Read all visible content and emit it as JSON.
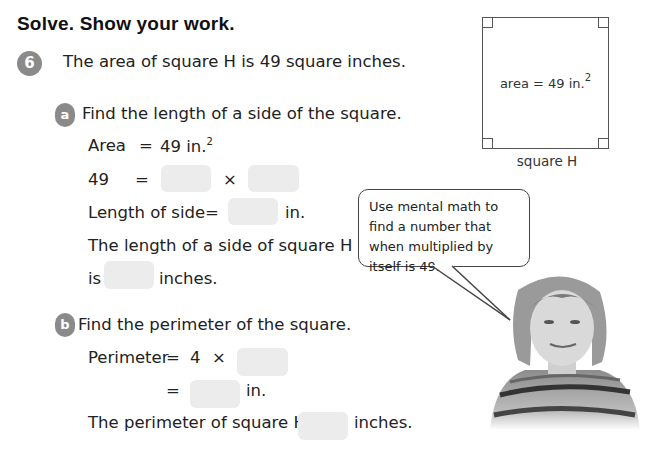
{
  "heading": "Solve. Show your work.",
  "problem": {
    "number": "6",
    "statement": "The area of square H is 49 square inches.",
    "part_a": {
      "letter": "a",
      "prompt": "Find the length of a side of the square.",
      "line1_label": "Area",
      "line1_eq": "=",
      "line1_value": "49 in.",
      "line1_sup": "2",
      "line2_label": "49",
      "line2_eq": "=",
      "line2_times": "×",
      "line3_label": "Length of side",
      "line3_eq": "=",
      "line3_unit": "in.",
      "line4": "The length of a side of square H",
      "line5_prefix": "is",
      "line5_suffix": "inches."
    },
    "part_b": {
      "letter": "b",
      "prompt": "Find the perimeter of the square.",
      "line1_label": "Perimeter",
      "line1_eq": "=",
      "line1_four": "4",
      "line1_times": "×",
      "line2_eq": "=",
      "line2_unit": "in.",
      "line3_prefix": "The perimeter of square H is",
      "line3_suffix": "inches."
    }
  },
  "figure": {
    "label": "area = 49 in.",
    "label_sup": "2",
    "caption": "square H"
  },
  "hint_bubble": "Use mental math to find a number that when multiplied by itself is 49.",
  "colors": {
    "badge": "#8a8a8a",
    "blank": "#ececec"
  }
}
